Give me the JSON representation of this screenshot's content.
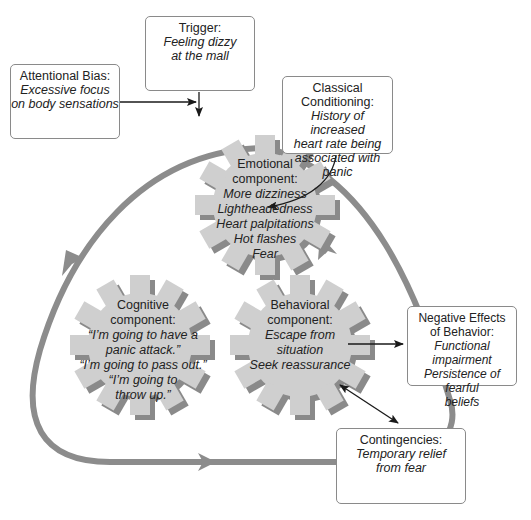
{
  "colors": {
    "loop": "#8c8c8c",
    "gear_fill": "#cfcfcf",
    "gear_shadow": "#8a8a8a",
    "box_border": "#8a8a8a",
    "connector": "#1a1a1a"
  },
  "boxes": {
    "trigger": {
      "title": "Trigger:",
      "body": "Feeling dizzy\nat the mall"
    },
    "attentional_bias": {
      "title": "Attentional Bias:",
      "body": "Excessive focus\non body sensations"
    },
    "classical_conditioning": {
      "title": "Classical\nConditioning:",
      "body": "History of increased\nheart rate being\nassociated with panic"
    },
    "negative_effects": {
      "title": "Negative Effects\nof Behavior:",
      "body": "Functional impairment\nPersistence of fearful\nbeliefs"
    },
    "contingencies": {
      "title": "Contingencies:",
      "body": "Temporary relief\nfrom fear"
    }
  },
  "gears": {
    "emotional": {
      "title": "Emotional\ncomponent:",
      "body": "More dizziness\nLightheadedness\nHeart palpitations\nHot flashes\nFear"
    },
    "cognitive": {
      "title": "Cognitive\ncomponent:",
      "body": "“I’m going to have a\npanic attack.”\n“I’m going to pass out.”\n“I’m going to\nthrow up.”"
    },
    "behavioral": {
      "title": "Behavioral\ncomponent:",
      "body": "Escape from\nsituation\nSeek reassurance"
    }
  },
  "loop": {
    "arrows": [
      "down-left on left side",
      "right on bottom",
      "up-left on right side"
    ]
  }
}
